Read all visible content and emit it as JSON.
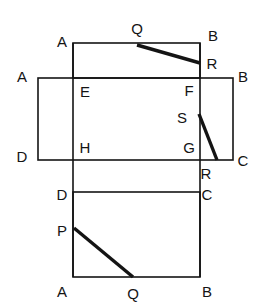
{
  "figure": {
    "canvas": {
      "width": 257,
      "height": 308
    },
    "stroke_color": "#141414",
    "background_color": "#ffffff",
    "thin_stroke_width": 1.6,
    "thick_stroke_width": 3.4,
    "rectangles": [
      {
        "name": "top-rectangle",
        "x": 73,
        "y": 43,
        "width": 127,
        "height": 35
      },
      {
        "name": "middle-rectangle",
        "x": 38,
        "y": 78,
        "width": 195,
        "height": 82
      },
      {
        "name": "bottom-rectangle",
        "x": 73,
        "y": 192,
        "width": 127,
        "height": 85
      }
    ],
    "segments": [
      {
        "name": "left-vertical-connector",
        "x1": 73,
        "y1": 43,
        "x2": 73,
        "y2": 277,
        "weight": "thin"
      },
      {
        "name": "right-vertical-connector",
        "x1": 200,
        "y1": 43,
        "x2": 200,
        "y2": 277,
        "weight": "thin"
      },
      {
        "name": "crease-Q-R-top",
        "x1": 137,
        "y1": 45,
        "x2": 200,
        "y2": 63,
        "weight": "thick"
      },
      {
        "name": "crease-S-R-middle",
        "x1": 199,
        "y1": 114,
        "x2": 217,
        "y2": 160,
        "weight": "thick"
      },
      {
        "name": "crease-P-Q-bottom",
        "x1": 74,
        "y1": 228,
        "x2": 133,
        "y2": 277,
        "weight": "thick"
      }
    ],
    "labels": [
      {
        "name": "label-A-top",
        "text": "A",
        "x": 62,
        "y": 41
      },
      {
        "name": "label-Q-top",
        "text": "Q",
        "x": 137,
        "y": 28
      },
      {
        "name": "label-B-top",
        "text": "B",
        "x": 213,
        "y": 35
      },
      {
        "name": "label-R-top",
        "text": "R",
        "x": 212,
        "y": 63
      },
      {
        "name": "label-A-middle",
        "text": "A",
        "x": 22,
        "y": 76
      },
      {
        "name": "label-B-middle",
        "text": "B",
        "x": 243,
        "y": 76
      },
      {
        "name": "label-E",
        "text": "E",
        "x": 85,
        "y": 91
      },
      {
        "name": "label-F",
        "text": "F",
        "x": 189,
        "y": 90
      },
      {
        "name": "label-S",
        "text": "S",
        "x": 182,
        "y": 117
      },
      {
        "name": "label-H",
        "text": "H",
        "x": 85,
        "y": 147
      },
      {
        "name": "label-G",
        "text": "G",
        "x": 189,
        "y": 147
      },
      {
        "name": "label-D-middle",
        "text": "D",
        "x": 22,
        "y": 156
      },
      {
        "name": "label-C-middle",
        "text": "C",
        "x": 243,
        "y": 160
      },
      {
        "name": "label-R-middle",
        "text": "R",
        "x": 206,
        "y": 173
      },
      {
        "name": "label-D-bottom",
        "text": "D",
        "x": 62,
        "y": 194
      },
      {
        "name": "label-C-bottom",
        "text": "C",
        "x": 207,
        "y": 194
      },
      {
        "name": "label-P",
        "text": "P",
        "x": 62,
        "y": 230
      },
      {
        "name": "label-A-bottom",
        "text": "A",
        "x": 62,
        "y": 291
      },
      {
        "name": "label-Q-bottom",
        "text": "Q",
        "x": 133,
        "y": 293
      },
      {
        "name": "label-B-bottom",
        "text": "B",
        "x": 207,
        "y": 291
      }
    ]
  }
}
